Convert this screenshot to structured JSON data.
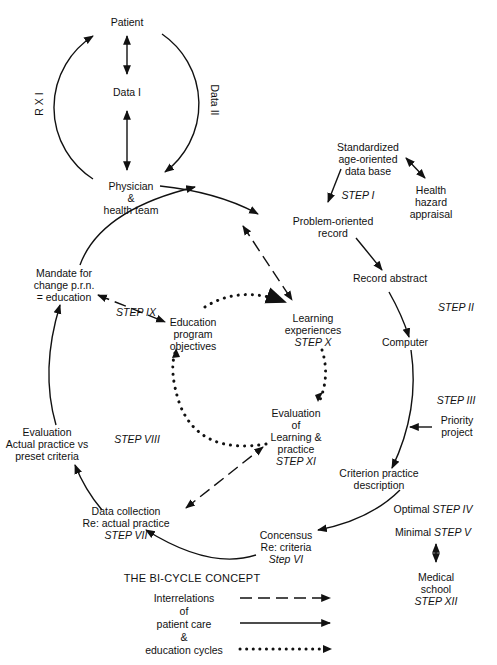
{
  "diagram": {
    "title": "THE BI-CYCLE CONCEPT",
    "top_cycle": {
      "patient": "Patient",
      "data1": "Data I",
      "rx": "R X I",
      "data2": "Data II"
    },
    "nodes": {
      "physician": [
        "Physician",
        "&",
        "health team"
      ],
      "standardized": [
        "Standardized",
        "age-oriented",
        "data base"
      ],
      "health_hazard": [
        "Health",
        "hazard",
        "appraisal"
      ],
      "step1": "STEP I",
      "problem_record": [
        "Problem-oriented",
        "record"
      ],
      "record_abstract": "Record abstract",
      "step2": "STEP II",
      "computer": "Computer",
      "step3": "STEP III",
      "priority_project": [
        "Priority",
        "project"
      ],
      "criterion": [
        "Criterion practice",
        "description"
      ],
      "optimal": "Optimal",
      "step4": "STEP IV",
      "minimal": "Minimal",
      "step5": "STEP V",
      "medical_school": [
        "Medical",
        "school"
      ],
      "step12": "STEP XII",
      "concensus": [
        "Concensus",
        "Re:  criteria"
      ],
      "step6": "Step VI",
      "data_collection": [
        "Data collection",
        "Re:  actual practice"
      ],
      "step7": "STEP VII",
      "evaluation": [
        "Evaluation",
        "Actual practice vs",
        "preset criteria"
      ],
      "step8": "STEP VIII",
      "mandate": [
        "Mandate for",
        "change p.r.n.",
        "= education"
      ],
      "step9": "STEP IX",
      "education_objectives": [
        "Education",
        "program",
        "objectives"
      ],
      "learning": [
        "Learning",
        "experiences"
      ],
      "step10": "STEP X",
      "evaluation_learning": [
        "Evaluation",
        "of",
        "Learning &",
        "practice"
      ],
      "step11": "STEP XI"
    },
    "legend": {
      "lines": [
        "Interrelations",
        "of",
        "patient care",
        "&",
        "education cycles"
      ],
      "items": [
        {
          "style": "dashed",
          "meaning": "Interrelations"
        },
        {
          "style": "solid",
          "meaning": "patient care"
        },
        {
          "style": "dotted",
          "meaning": "education cycles"
        }
      ]
    },
    "colors": {
      "ink": "#111111",
      "background": "#ffffff"
    }
  }
}
